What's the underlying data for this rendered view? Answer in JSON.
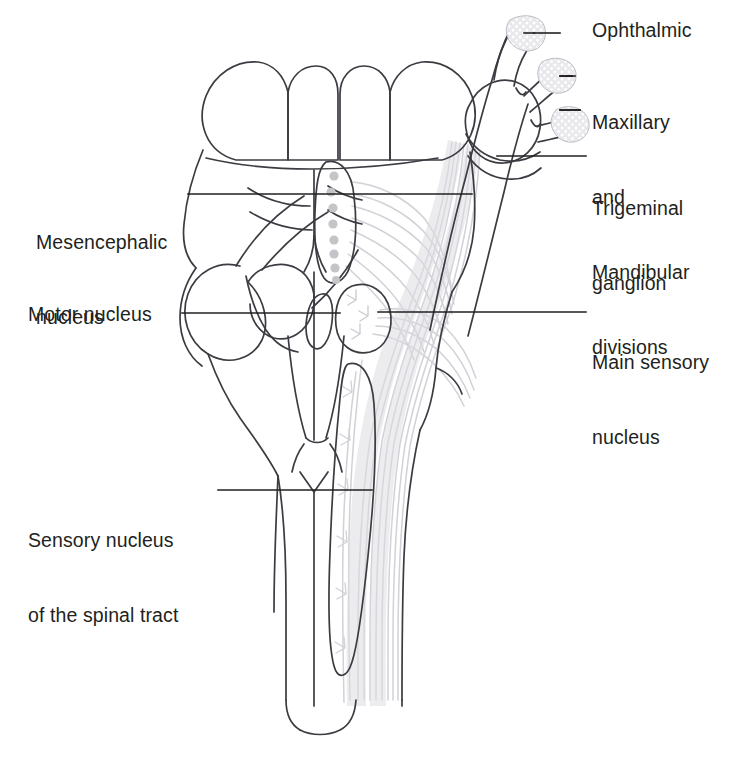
{
  "figure": {
    "view": "dorsal view of brainstem",
    "colors": {
      "outline": "#3b3b42",
      "leader": "#231f20",
      "text": "#231f20",
      "fiber_gray": "#c9c9cf",
      "nucleus_dot": "#c4c4c9",
      "ganglion_fill": "#e2e2e6",
      "background": "#ffffff"
    }
  },
  "labels": {
    "ophthalmic": {
      "lines": [
        "Ophthalmic"
      ],
      "side": "right",
      "x": 592,
      "y": 18,
      "leader": {
        "x1": 560,
        "y1": 33,
        "x2": 541,
        "y2": 33
      }
    },
    "maxillary_mandibular": {
      "lines": [
        "Maxillary",
        "and",
        "Mandibular",
        "divisions"
      ],
      "side": "right",
      "x": 592,
      "y": 60,
      "leader_top": {
        "x1": 560,
        "y1": 76,
        "x2": 548,
        "y2": 76
      },
      "leader_bottom": {
        "x1": 560,
        "y1": 110,
        "x2": 549,
        "y2": 110
      }
    },
    "trigeminal_ganglion": {
      "lines": [
        "Trigeminal",
        "ganglion"
      ],
      "side": "right",
      "x": 592,
      "y": 146,
      "leader": {
        "x1": 586,
        "y1": 156,
        "x2": 497,
        "y2": 156
      }
    },
    "main_sensory_nucleus": {
      "lines": [
        "Main sensory",
        "nucleus"
      ],
      "side": "right",
      "x": 592,
      "y": 300,
      "leader": {
        "x1": 586,
        "y1": 312,
        "x2": 378,
        "y2": 312
      }
    },
    "mesencephalic_nucleus": {
      "lines": [
        "Mesencephalic",
        "nucleus"
      ],
      "side": "left",
      "x": 36,
      "y": 180,
      "leader": {
        "x1": 188,
        "y1": 194,
        "x2": 472,
        "y2": 194
      }
    },
    "motor_nucleus": {
      "lines": [
        "Motor nucleus"
      ],
      "side": "left",
      "x": 28,
      "y": 302,
      "leader": {
        "x1": 182,
        "y1": 313,
        "x2": 340,
        "y2": 313
      }
    },
    "sensory_nucleus_spinal_tract": {
      "lines": [
        "Sensory nucleus",
        "of the spinal tract"
      ],
      "side": "left",
      "x": 28,
      "y": 478,
      "leader": {
        "x1": 218,
        "y1": 490,
        "x2": 372,
        "y2": 490
      }
    }
  },
  "structures": {
    "colliculi": {
      "name": "superior and inferior colliculi",
      "count": 4
    },
    "cerebellar_peduncles": {
      "name": "cut cerebellar peduncles",
      "count": 2
    },
    "mesencephalic_nucleus_cells": {
      "name": "mesencephalic nucleus cell bodies",
      "count": 8
    },
    "spinal_tract_nucleus": {
      "name": "sensory nucleus of the spinal tract"
    },
    "spinal_cord": {
      "name": "spinal cord"
    },
    "trigeminal_fiber_tract": {
      "name": "trigeminal nerve fibers"
    }
  }
}
